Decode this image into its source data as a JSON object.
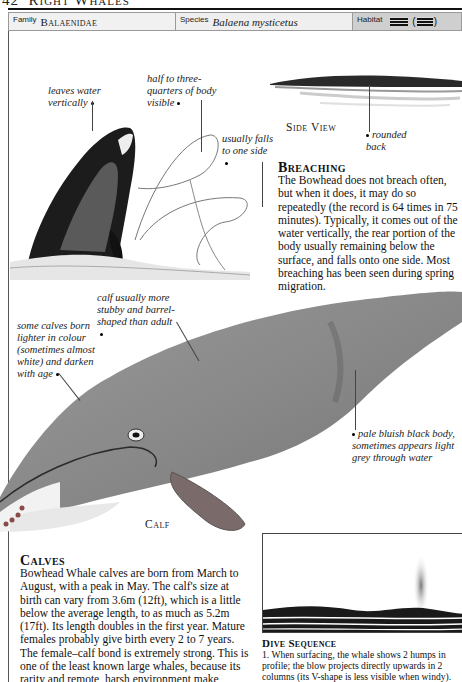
{
  "page_header": {
    "page_number": "42",
    "title": "Right Whales"
  },
  "info_bar": {
    "family_label": "Family",
    "family_value": "Balaenidae",
    "species_label": "Species",
    "species_value": "Balaena mysticetus",
    "habitat_label": "Habitat",
    "habitat_icons": [
      "open-ocean-icon",
      "coastal-waters-icon"
    ],
    "habitat_paren_open": "(",
    "habitat_paren_close": ")"
  },
  "breaching_illustration": {
    "annotations": [
      {
        "text": "leaves water vertically"
      },
      {
        "text": "half to three-quarters of body visible"
      },
      {
        "text": "usually falls to one side"
      }
    ]
  },
  "side_view": {
    "caption": "Side View",
    "annotation": "rounded back"
  },
  "breaching": {
    "title": "Breaching",
    "body": "The Bowhead does not breach often, but when it does, it may do so repeatedly (the record is 64 times in 75 minutes). Typically, it comes out of the water vertically, the rear portion of the body usually remaining below the surface, and falls onto one side. Most breaching has been seen during spring migration."
  },
  "calf_illustration": {
    "caption": "Calf",
    "annotations": [
      {
        "text": "calf usually more stubby and barrel-shaped than adult"
      },
      {
        "text": "some calves born lighter in colour (sometimes almost white) and darken with age"
      },
      {
        "text": "pale bluish black body, sometimes appears light grey through water"
      }
    ]
  },
  "calves": {
    "title": "Calves",
    "body": "Bowhead Whale calves are born from March to August, with a peak in May. The calf's size at birth can vary from 3.6m (12ft), which is a little below the average length, to as much as 5.2m (17ft). Its length doubles in the first year. Mature females probably give birth every 2 to 7 years. The female–calf bond is extremely strong. This is one of the least known large whales, because its rarity and remote, harsh environment make research difficult."
  },
  "dive_sequence": {
    "title": "Dive Sequence",
    "body": "1. When surfacing, the whale shows 2 humps in profile; the blow projects directly upwards in 2 columns (its V-shape is less visible when windy)."
  },
  "colors": {
    "habitat_cell_bg": "#cfcfcf",
    "whale_dark": "#1c1c1c",
    "calf_body": "#8a8a8a",
    "flipper": "#7a6a6a"
  }
}
